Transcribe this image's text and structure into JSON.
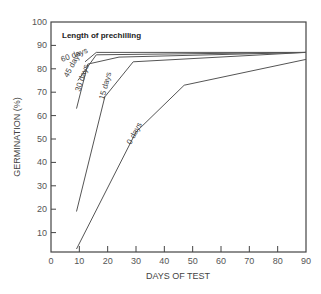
{
  "chart_data": {
    "type": "line",
    "title": "",
    "legend_title": "Length of prechilling",
    "xlabel": "DAYS OF TEST",
    "ylabel": "GERMINATION (%)",
    "xlim": [
      0,
      90
    ],
    "ylim": [
      0,
      100
    ],
    "x_ticks": [
      0,
      10,
      20,
      30,
      40,
      50,
      60,
      70,
      80,
      90
    ],
    "y_ticks": [
      10,
      20,
      30,
      40,
      50,
      60,
      70,
      80,
      90,
      100
    ],
    "grid": false,
    "series": [
      {
        "name": "60 days",
        "points": [
          [
            12,
            83
          ],
          [
            16,
            87
          ],
          [
            90,
            87
          ]
        ]
      },
      {
        "name": "45 days",
        "points": [
          [
            9.5,
            75
          ],
          [
            16,
            86
          ],
          [
            90,
            87
          ]
        ]
      },
      {
        "name": "30 days",
        "points": [
          [
            9,
            63
          ],
          [
            13,
            82
          ],
          [
            24,
            85
          ],
          [
            90,
            87
          ]
        ]
      },
      {
        "name": "15 days",
        "points": [
          [
            9,
            19
          ],
          [
            19,
            68
          ],
          [
            29,
            83
          ],
          [
            90,
            87
          ]
        ]
      },
      {
        "name": "0 days",
        "points": [
          [
            9,
            3
          ],
          [
            30,
            53
          ],
          [
            47,
            73
          ],
          [
            90,
            84
          ]
        ]
      }
    ]
  }
}
